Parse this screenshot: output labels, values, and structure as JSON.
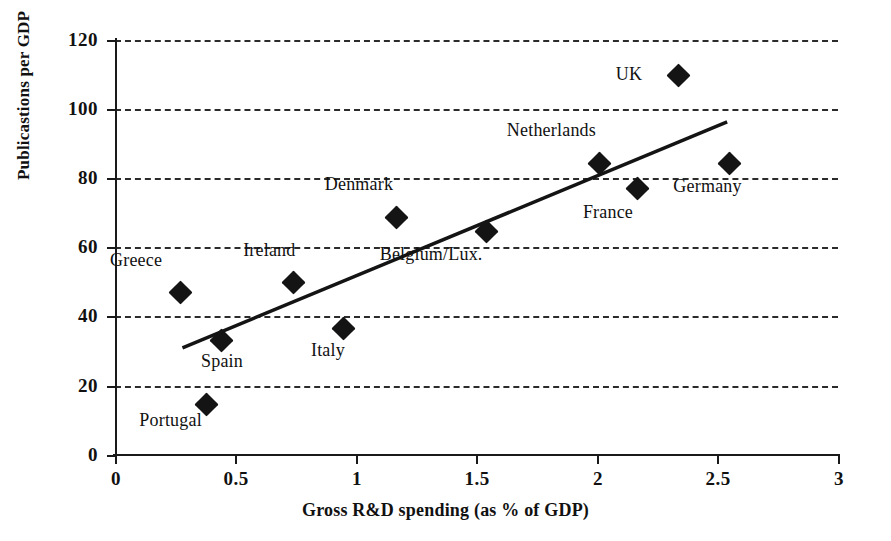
{
  "chart_data": {
    "type": "scatter",
    "title": "",
    "xlabel": "Gross R&D spending (as % of GDP)",
    "ylabel": "Publicastions per GDP",
    "xlim": [
      0,
      3
    ],
    "ylim": [
      0,
      120
    ],
    "xticks": [
      "0",
      "0.5",
      "1",
      "1.5",
      "2",
      "2.5",
      "3"
    ],
    "xtick_values": [
      0,
      0.5,
      1,
      1.5,
      2,
      2.5,
      3
    ],
    "yticks": [
      "0",
      "20",
      "40",
      "60",
      "80",
      "100",
      "120"
    ],
    "ytick_values": [
      0,
      20,
      40,
      60,
      80,
      100,
      120
    ],
    "grid": "horizontal-dashed",
    "legend": "none",
    "marker": "filled-diamond",
    "marker_color": "#141414",
    "points": [
      {
        "label": "Greece",
        "x": 0.27,
        "y": 47.1,
        "label_dx": -44,
        "label_dy": -32
      },
      {
        "label": "Portugal",
        "x": 0.38,
        "y": 14.7,
        "label_dx": -36,
        "label_dy": 16
      },
      {
        "label": "Spain",
        "x": 0.44,
        "y": 33.0,
        "label_dx": 1,
        "label_dy": 20
      },
      {
        "label": "Ireland",
        "x": 0.74,
        "y": 50.0,
        "label_dx": -24,
        "label_dy": -32
      },
      {
        "label": "Italy",
        "x": 0.95,
        "y": 36.5,
        "label_dx": -16,
        "label_dy": 21
      },
      {
        "label": "Denmark",
        "x": 1.17,
        "y": 68.8,
        "label_dx": -38,
        "label_dy": -33
      },
      {
        "label": "Belgium/Lux.",
        "x": 1.54,
        "y": 64.5,
        "label_dx": -55,
        "label_dy": 22
      },
      {
        "label": "Netherlands",
        "x": 2.01,
        "y": 84.4,
        "label_dx": -48,
        "label_dy": -33
      },
      {
        "label": "France",
        "x": 2.17,
        "y": 77.0,
        "label_dx": -30,
        "label_dy": 23
      },
      {
        "label": "UK",
        "x": 2.34,
        "y": 109.6,
        "label_dx": -50,
        "label_dy": -2
      },
      {
        "label": "Germany",
        "x": 2.55,
        "y": 84.4,
        "label_dx": -22,
        "label_dy": 23
      }
    ],
    "trend_line": {
      "x0": 0.28,
      "y0": 31.0,
      "x1": 2.54,
      "y1": 96.3,
      "color": "#141414",
      "width": 3.5
    }
  }
}
